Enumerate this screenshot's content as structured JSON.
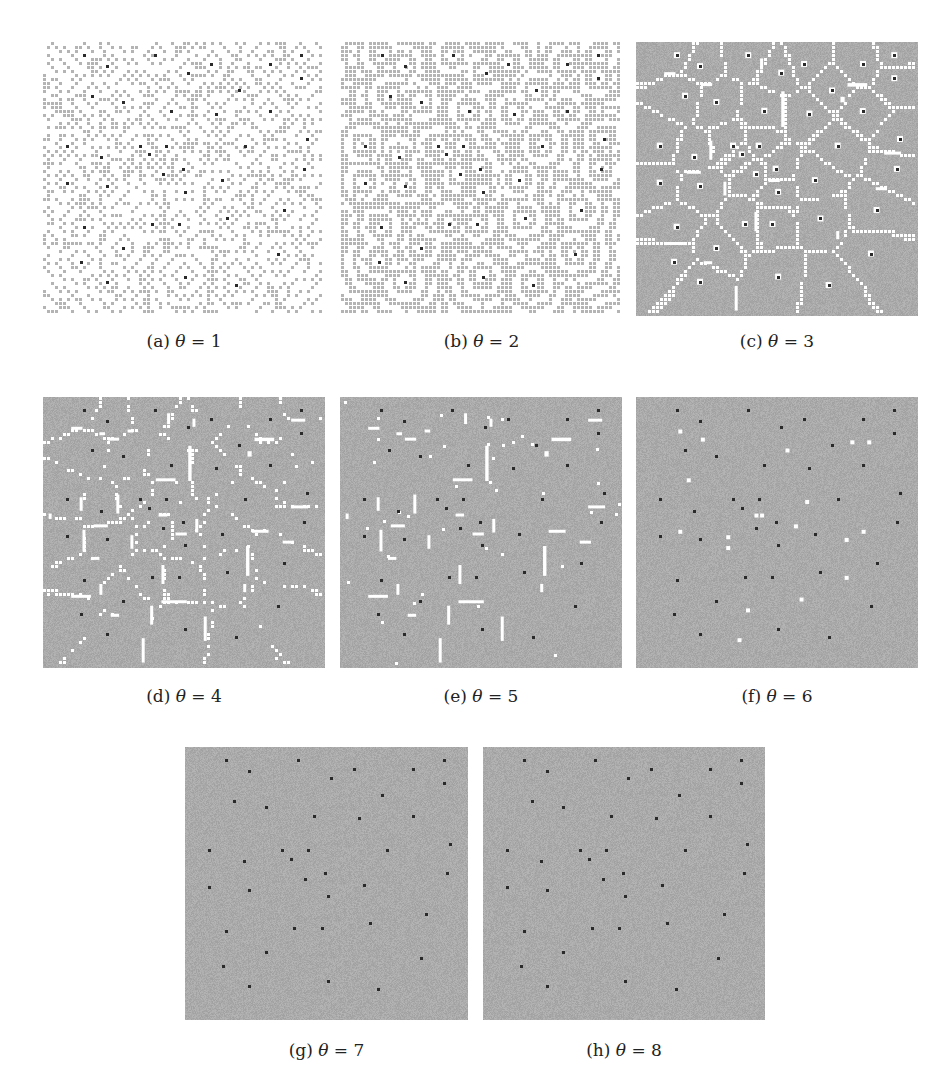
{
  "figure": {
    "panels": [
      {
        "id": "a",
        "label": "(a)",
        "symbol": "θ",
        "eq": "= 1",
        "theta": 1,
        "style": "sparse-rings",
        "x": 43,
        "y": 42,
        "w": 282,
        "h": 274
      },
      {
        "id": "b",
        "label": "(b)",
        "symbol": "θ",
        "eq": "= 2",
        "theta": 2,
        "style": "dense-rings",
        "x": 341,
        "y": 42,
        "w": 281,
        "h": 274
      },
      {
        "id": "c",
        "label": "(c)",
        "symbol": "θ",
        "eq": "= 3",
        "theta": 3,
        "style": "voronoi",
        "x": 636,
        "y": 42,
        "w": 282,
        "h": 274
      },
      {
        "id": "d",
        "label": "(d)",
        "symbol": "θ",
        "eq": "= 4",
        "theta": 4,
        "style": "voronoi-broken",
        "x": 43,
        "y": 397,
        "w": 282,
        "h": 271
      },
      {
        "id": "e",
        "label": "(e)",
        "symbol": "θ",
        "eq": "= 5",
        "theta": 5,
        "style": "segments",
        "x": 340,
        "y": 397,
        "w": 282,
        "h": 271
      },
      {
        "id": "f",
        "label": "(f)",
        "symbol": "θ",
        "eq": "= 6",
        "theta": 6,
        "style": "few-specks",
        "x": 636,
        "y": 397,
        "w": 282,
        "h": 271
      },
      {
        "id": "g",
        "label": "(g)",
        "symbol": "θ",
        "eq": "= 7",
        "theta": 7,
        "style": "dots-only",
        "x": 185,
        "y": 747,
        "w": 283,
        "h": 273
      },
      {
        "id": "h",
        "label": "(h)",
        "symbol": "θ",
        "eq": "= 8",
        "theta": 8,
        "style": "dots-only",
        "x": 483,
        "y": 747,
        "w": 282,
        "h": 273
      }
    ],
    "captions_y": {
      "row1": 331,
      "row2": 686,
      "row3": 1040
    },
    "colors": {
      "gray": "#a8a8a8",
      "white": "#ffffff",
      "dot": "#2a2a2a",
      "ring": "#b4b4b4"
    },
    "seeds": [
      [
        0.145,
        0.048
      ],
      [
        0.398,
        0.048
      ],
      [
        0.916,
        0.048
      ],
      [
        0.227,
        0.088
      ],
      [
        0.596,
        0.08
      ],
      [
        0.805,
        0.08
      ],
      [
        0.515,
        0.112
      ],
      [
        0.916,
        0.132
      ],
      [
        0.174,
        0.196
      ],
      [
        0.695,
        0.177
      ],
      [
        0.285,
        0.219
      ],
      [
        0.455,
        0.251
      ],
      [
        0.615,
        0.261
      ],
      [
        0.804,
        0.252
      ],
      [
        0.936,
        0.354
      ],
      [
        0.084,
        0.378
      ],
      [
        0.344,
        0.378
      ],
      [
        0.435,
        0.378
      ],
      [
        0.715,
        0.378
      ],
      [
        0.207,
        0.419
      ],
      [
        0.375,
        0.41
      ],
      [
        0.495,
        0.462
      ],
      [
        0.925,
        0.463
      ],
      [
        0.425,
        0.482
      ],
      [
        0.634,
        0.504
      ],
      [
        0.084,
        0.513
      ],
      [
        0.227,
        0.525
      ],
      [
        0.504,
        0.547
      ],
      [
        0.853,
        0.613
      ],
      [
        0.654,
        0.644
      ],
      [
        0.144,
        0.674
      ],
      [
        0.386,
        0.664
      ],
      [
        0.484,
        0.664
      ],
      [
        0.285,
        0.752
      ],
      [
        0.833,
        0.772
      ],
      [
        0.135,
        0.802
      ],
      [
        0.504,
        0.856
      ],
      [
        0.227,
        0.875
      ],
      [
        0.683,
        0.887
      ]
    ],
    "segments_e": [
      [
        0.44,
        0.06,
        0.01,
        0.04
      ],
      [
        0.53,
        0.08,
        0.01,
        0.03
      ],
      [
        0.1,
        0.11,
        0.04,
        0.01
      ],
      [
        0.2,
        0.13,
        0.02,
        0.01
      ],
      [
        0.23,
        0.15,
        0.04,
        0.01
      ],
      [
        0.3,
        0.12,
        0.02,
        0.01
      ],
      [
        0.75,
        0.15,
        0.07,
        0.013
      ],
      [
        0.88,
        0.08,
        0.05,
        0.01
      ],
      [
        0.515,
        0.18,
        0.012,
        0.13
      ],
      [
        0.4,
        0.3,
        0.07,
        0.01
      ],
      [
        0.725,
        0.2,
        0.015,
        0.02
      ],
      [
        0.13,
        0.37,
        0.01,
        0.05
      ],
      [
        0.26,
        0.36,
        0.01,
        0.07
      ],
      [
        0.41,
        0.43,
        0.03,
        0.01
      ],
      [
        0.18,
        0.47,
        0.05,
        0.01
      ],
      [
        0.14,
        0.49,
        0.01,
        0.08
      ],
      [
        0.31,
        0.51,
        0.01,
        0.05
      ],
      [
        0.54,
        0.45,
        0.01,
        0.05
      ],
      [
        0.47,
        0.5,
        0.04,
        0.01
      ],
      [
        0.74,
        0.49,
        0.06,
        0.01
      ],
      [
        0.85,
        0.53,
        0.04,
        0.01
      ],
      [
        0.72,
        0.55,
        0.012,
        0.11
      ],
      [
        0.88,
        0.4,
        0.06,
        0.01
      ],
      [
        0.17,
        0.59,
        0.03,
        0.01
      ],
      [
        0.42,
        0.62,
        0.01,
        0.07
      ],
      [
        0.2,
        0.69,
        0.01,
        0.04
      ],
      [
        0.1,
        0.73,
        0.07,
        0.01
      ],
      [
        0.42,
        0.75,
        0.09,
        0.01
      ],
      [
        0.71,
        0.69,
        0.01,
        0.03
      ],
      [
        0.38,
        0.77,
        0.01,
        0.07
      ],
      [
        0.24,
        0.8,
        0.03,
        0.01
      ],
      [
        0.57,
        0.81,
        0.01,
        0.09
      ],
      [
        0.35,
        0.89,
        0.01,
        0.09
      ],
      [
        0.02,
        0.43,
        0.01,
        0.02
      ]
    ],
    "specks_f": [
      [
        0.15,
        0.12
      ],
      [
        0.23,
        0.15
      ],
      [
        0.53,
        0.19
      ],
      [
        0.76,
        0.16
      ],
      [
        0.82,
        0.16
      ],
      [
        0.18,
        0.3
      ],
      [
        0.6,
        0.38
      ],
      [
        0.42,
        0.43
      ],
      [
        0.44,
        0.43
      ],
      [
        0.56,
        0.47
      ],
      [
        0.15,
        0.49
      ],
      [
        0.32,
        0.51
      ],
      [
        0.32,
        0.55
      ],
      [
        0.74,
        0.52
      ],
      [
        0.8,
        0.49
      ],
      [
        0.74,
        0.66
      ],
      [
        0.58,
        0.74
      ],
      [
        0.39,
        0.78
      ],
      [
        0.36,
        0.89
      ]
    ]
  }
}
